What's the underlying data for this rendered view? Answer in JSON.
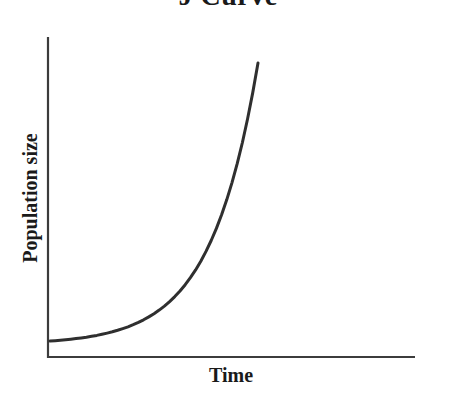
{
  "chart_data": {
    "type": "line",
    "title": "J Curve",
    "xlabel": "Time",
    "ylabel": "Population size",
    "axis_ticks": "none",
    "tick_labels": [],
    "grid": false,
    "legend": "none",
    "note": "Conceptual exponential (J-shaped) growth curve; axes carry no numeric scale. x and y are fractions of the plotted range.",
    "colors": {
      "curve": "#2f2f2f",
      "axis": "#3c3c3c",
      "background": "#ffffff",
      "text": "#1a1a1a"
    },
    "series": [
      {
        "name": "Population size",
        "x": [
          0,
          0.025,
          0.05,
          0.075,
          0.1,
          0.125,
          0.15,
          0.175,
          0.2,
          0.225,
          0.25,
          0.275,
          0.3,
          0.325,
          0.35,
          0.375,
          0.4,
          0.425,
          0.45,
          0.475,
          0.5,
          0.525,
          0.55,
          0.575,
          0.6,
          0.625,
          0.65,
          0.675,
          0.7,
          0.725,
          0.75,
          0.775,
          0.8,
          0.825,
          0.85,
          0.875,
          0.9,
          0.925,
          0.95,
          0.975,
          1
        ],
        "y": [
          0.0541,
          0.0555,
          0.0569,
          0.0586,
          0.0605,
          0.0626,
          0.0649,
          0.0675,
          0.0704,
          0.0736,
          0.0772,
          0.0813,
          0.0858,
          0.0908,
          0.0965,
          0.1028,
          0.1098,
          0.1177,
          0.1265,
          0.1363,
          0.1472,
          0.1595,
          0.1732,
          0.1884,
          0.2055,
          0.2246,
          0.2459,
          0.2696,
          0.2962,
          0.3259,
          0.3591,
          0.3961,
          0.4375,
          0.4838,
          0.5354,
          0.5931,
          0.6576,
          0.7296,
          0.8101,
          0.9,
          1
        ]
      }
    ]
  }
}
